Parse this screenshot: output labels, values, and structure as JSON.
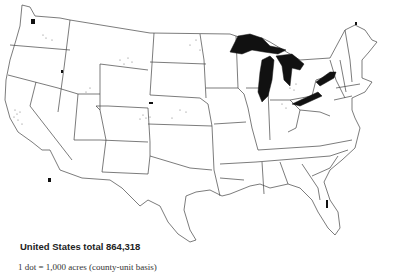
{
  "map": {
    "subject": "United States dot-density map",
    "total_label": "United States total 864,318",
    "legend_label": "1 dot = 1,000 acres (county-unit basis)",
    "colors": {
      "background": "#ffffff",
      "outline": "#444444",
      "lakes": "#111111",
      "dots": "#777777"
    },
    "features": [
      "state-boundaries",
      "great-lakes",
      "dot-clusters"
    ]
  }
}
